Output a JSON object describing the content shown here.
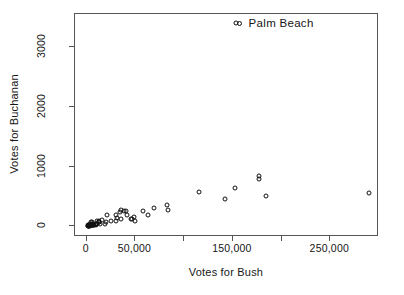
{
  "chart_data": {
    "type": "scatter",
    "title": "",
    "xlabel": "Votes for Bush",
    "ylabel": "Votes for Buchanan",
    "xlim": [
      -12000,
      300000
    ],
    "ylim": [
      -180,
      3560
    ],
    "grid": false,
    "legend": "none",
    "marker": "open-circle",
    "x_ticks": [
      0,
      50000,
      100000,
      150000,
      200000,
      250000
    ],
    "x_ticklabels": [
      "0",
      "50,000",
      "",
      "150,000",
      "",
      "250,000"
    ],
    "y_ticks": [
      0,
      1000,
      2000,
      3000
    ],
    "y_ticklabels": [
      "0",
      "1000",
      "2000",
      "3000"
    ],
    "annotations": [
      {
        "label": "Palm Beach",
        "x": 152846,
        "y": 3407,
        "marker": "open-circle"
      }
    ],
    "series": [
      {
        "name": "Florida counties",
        "points": [
          {
            "x": 2873,
            "y": 9
          },
          {
            "x": 5610,
            "y": 22
          },
          {
            "x": 38637,
            "y": 248
          },
          {
            "x": 5414,
            "y": 65
          },
          {
            "x": 115185,
            "y": 570
          },
          {
            "x": 29744,
            "y": 90
          },
          {
            "x": 41745,
            "y": 182
          },
          {
            "x": 2177,
            "y": 26
          },
          {
            "x": 35419,
            "y": 270
          },
          {
            "x": 29641,
            "y": 186
          },
          {
            "x": 177323,
            "y": 789
          },
          {
            "x": 9138,
            "y": 29
          },
          {
            "x": 4511,
            "y": 33
          },
          {
            "x": 177279,
            "y": 836
          },
          {
            "x": 12176,
            "y": 90
          },
          {
            "x": 4256,
            "y": 29
          },
          {
            "x": 289456,
            "y": 561
          },
          {
            "x": 45369,
            "y": 127
          },
          {
            "x": 1316,
            "y": 7
          },
          {
            "x": 4018,
            "y": 13
          },
          {
            "x": 2448,
            "y": 17
          },
          {
            "x": 9048,
            "y": 37
          },
          {
            "x": 1669,
            "y": 10
          },
          {
            "x": 57948,
            "y": 250
          },
          {
            "x": 1511,
            "y": 29
          },
          {
            "x": 4051,
            "y": 69
          },
          {
            "x": 34124,
            "y": 242
          },
          {
            "x": 34705,
            "y": 122
          },
          {
            "x": 184312,
            "y": 505
          },
          {
            "x": 12126,
            "y": 75
          },
          {
            "x": 20196,
            "y": 78
          },
          {
            "x": 18850,
            "y": 45
          },
          {
            "x": 16059,
            "y": 104
          },
          {
            "x": 6962,
            "y": 29
          },
          {
            "x": 6858,
            "y": 44
          },
          {
            "x": 7359,
            "y": 28
          },
          {
            "x": 31287,
            "y": 147
          },
          {
            "x": 5093,
            "y": 27
          },
          {
            "x": 2326,
            "y": 9
          },
          {
            "x": 3038,
            "y": 23
          },
          {
            "x": 48973,
            "y": 152
          },
          {
            "x": 62615,
            "y": 191
          },
          {
            "x": 49963,
            "y": 89
          },
          {
            "x": 4512,
            "y": 24
          },
          {
            "x": 5187,
            "y": 29
          },
          {
            "x": 83100,
            "y": 270
          },
          {
            "x": 2153,
            "y": 9
          },
          {
            "x": 3867,
            "y": 12
          },
          {
            "x": 152846,
            "y": 3407
          },
          {
            "x": 5646,
            "y": 35
          },
          {
            "x": 68582,
            "y": 305
          },
          {
            "x": 46698,
            "y": 124
          },
          {
            "x": 2448,
            "y": 18
          },
          {
            "x": 12188,
            "y": 68
          },
          {
            "x": 4056,
            "y": 24
          },
          {
            "x": 82883,
            "y": 355
          },
          {
            "x": 142237,
            "y": 455
          },
          {
            "x": 9637,
            "y": 38
          },
          {
            "x": 24864,
            "y": 88
          },
          {
            "x": 10345,
            "y": 39
          },
          {
            "x": 6178,
            "y": 22
          },
          {
            "x": 20712,
            "y": 197
          },
          {
            "x": 13230,
            "y": 40
          },
          {
            "x": 7244,
            "y": 22
          },
          {
            "x": 40749,
            "y": 260
          },
          {
            "x": 10570,
            "y": 90
          },
          {
            "x": 152082,
            "y": 650
          }
        ]
      }
    ]
  }
}
